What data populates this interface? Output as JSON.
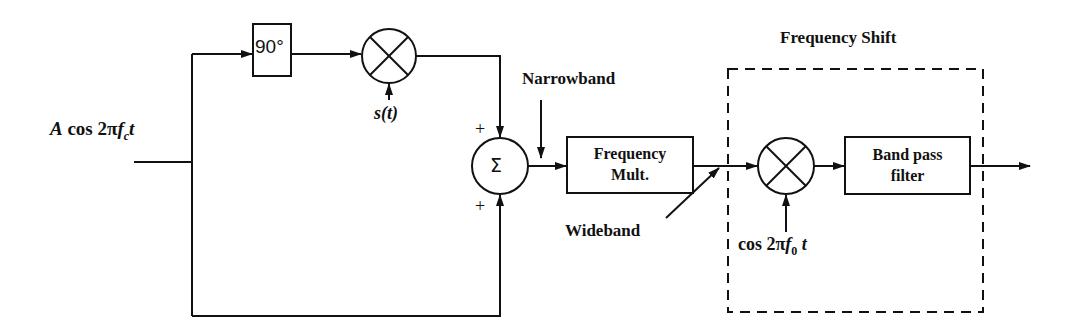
{
  "diagram": {
    "input_signal": "A cos 2πf",
    "input_signal_sub": "c",
    "input_signal_tail": "t",
    "phase_shift_block": "90°",
    "mixer1_input": "s(t)",
    "sum_symbol": "Σ",
    "sum_sign_top": "+",
    "sum_sign_bottom": "+",
    "narrowband_label": "Narrowband",
    "freq_mult_line1": "Frequency",
    "freq_mult_line2": "Mult.",
    "wideband_label": "Wideband",
    "freq_shift_title": "Frequency Shift",
    "mixer2_input": "cos 2πf",
    "mixer2_input_sub": "0",
    "mixer2_input_tail": " t",
    "bpf_line1": "Band pass",
    "bpf_line2": "filter"
  }
}
